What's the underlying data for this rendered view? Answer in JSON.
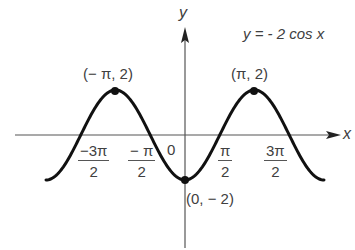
{
  "chart_data": {
    "type": "line",
    "xlabel": "x",
    "ylabel": "y",
    "function": "y = -2 cos x",
    "amplitude": 2,
    "period": "2π",
    "x_range": [
      "-2π",
      "2π"
    ],
    "y_range": [
      -2,
      2
    ],
    "grid": false,
    "legend": null,
    "x_ticks": [
      {
        "label": "-3π/2",
        "num": "−3π",
        "den": "2",
        "value": -4.712
      },
      {
        "label": "-π/2",
        "num": "−π",
        "den": "2",
        "value": -1.571
      },
      {
        "label": "0",
        "value": 0
      },
      {
        "label": "π/2",
        "num": "π",
        "den": "2",
        "value": 1.571
      },
      {
        "label": "3π/2",
        "num": "3π",
        "den": "2",
        "value": 4.712
      }
    ],
    "annotated_points": [
      {
        "label": "(−π, 2)",
        "x": -3.1416,
        "y": 2
      },
      {
        "label": "(π, 2)",
        "x": 3.1416,
        "y": 2
      },
      {
        "label": "(0, −2)",
        "x": 0,
        "y": -2
      }
    ],
    "series": [
      {
        "name": "y = -2 cos x",
        "x": [
          -6.283,
          -4.712,
          -3.142,
          -1.571,
          0,
          1.571,
          3.142,
          4.712,
          6.283
        ],
        "values": [
          -2,
          0,
          2,
          0,
          -2,
          0,
          2,
          0,
          -2
        ]
      }
    ]
  },
  "labels": {
    "equation": "y = - 2 cos x",
    "axis_x": "x",
    "axis_y": "y",
    "origin": "0",
    "point_left_peak": "(− π, 2)",
    "point_right_peak": "(π, 2)",
    "point_min": "(0, − 2)",
    "tick_neg_3pi_2_num": "−3π",
    "tick_neg_3pi_2_den": "2",
    "tick_neg_pi_2_num": "− π",
    "tick_neg_pi_2_den": "2",
    "tick_pi_2_num": "π",
    "tick_pi_2_den": "2",
    "tick_3pi_2_num": "3π",
    "tick_3pi_2_den": "2"
  },
  "colors": {
    "curve": "#111111",
    "axes": "#555555",
    "text": "#404040",
    "background": "#ffffff"
  }
}
